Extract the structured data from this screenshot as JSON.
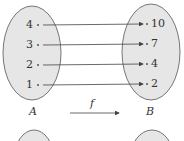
{
  "diagram": {
    "type": "function-mapping",
    "function_name": "f",
    "domain": {
      "name": "A",
      "elements": [
        "4",
        "3",
        "2",
        "1"
      ]
    },
    "codomain": {
      "name": "B",
      "elements": [
        "10",
        "7",
        "4",
        "2"
      ]
    },
    "mappings": [
      {
        "from": "4",
        "to": "10"
      },
      {
        "from": "3",
        "to": "7"
      },
      {
        "from": "2",
        "to": "4"
      },
      {
        "from": "1",
        "to": "2"
      }
    ],
    "colors": {
      "set_fill": "#e6e6e6",
      "outline": "#555555",
      "arrow": "#444444",
      "text": "#333333"
    }
  }
}
